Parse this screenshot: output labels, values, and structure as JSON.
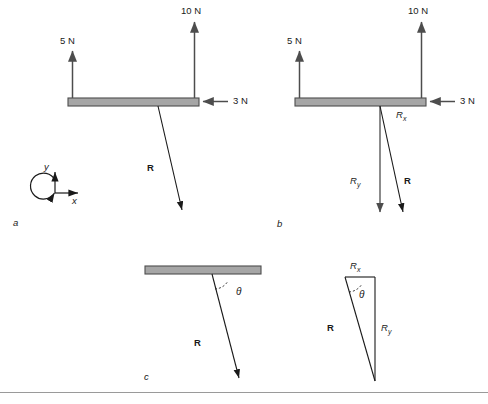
{
  "figure": {
    "title": "",
    "background_color": "#ffffff",
    "beam_fill": "#a6a6a6",
    "beam_stroke": "#4d4d4d",
    "arrow_color": "#4d4d4d",
    "vector_color": "#1a1a1a",
    "rule_color": "#9a9a9a"
  },
  "panels": [
    {
      "id": "a",
      "label": "a",
      "forces": [
        {
          "name": "force-5N",
          "label": "5 N",
          "direction": "up"
        },
        {
          "name": "force-10N",
          "label": "10 N",
          "direction": "up"
        },
        {
          "name": "force-3N",
          "label": "3 N",
          "direction": "left"
        }
      ],
      "vectors": [
        {
          "name": "resultant",
          "label": "R",
          "bold": true
        }
      ],
      "axes": {
        "x_label": "x",
        "y_label": "y",
        "rotation_icon": "curved-ccw-arrow"
      }
    },
    {
      "id": "b",
      "label": "b",
      "forces": [
        {
          "name": "force-5N",
          "label": "5 N",
          "direction": "up"
        },
        {
          "name": "force-10N",
          "label": "10 N",
          "direction": "up"
        },
        {
          "name": "force-3N",
          "label": "3 N",
          "direction": "left"
        }
      ],
      "vectors": [
        {
          "name": "component-x",
          "label": "R",
          "subscript": "x"
        },
        {
          "name": "component-y",
          "label": "R",
          "subscript": "y"
        },
        {
          "name": "resultant",
          "label": "R",
          "bold": true
        }
      ]
    },
    {
      "id": "c",
      "label": "c",
      "vectors": [
        {
          "name": "resultant",
          "label": "R",
          "bold": true
        }
      ],
      "angle": {
        "label": "θ",
        "name": "angle-theta"
      }
    },
    {
      "id": "triangle",
      "label": "",
      "vectors": [
        {
          "name": "component-x",
          "label": "R",
          "subscript": "x"
        },
        {
          "name": "component-y",
          "label": "R",
          "subscript": "y"
        },
        {
          "name": "resultant",
          "label": "R",
          "bold": true
        }
      ],
      "angle": {
        "label": "θ",
        "name": "angle-theta"
      }
    }
  ],
  "labels": {
    "ten_n_a": "10 N",
    "five_n_a": "5 N",
    "three_n_a": "3 N",
    "R_a": "R",
    "axis_x": "x",
    "axis_y": "y",
    "panel_a": "a",
    "ten_n_b": "10 N",
    "five_n_b": "5 N",
    "three_n_b": "3 N",
    "R_b": "R",
    "Rx_b": "R",
    "Rx_b_sub": "x",
    "Ry_b": "R",
    "Ry_b_sub": "y",
    "panel_b": "b",
    "R_c": "R",
    "theta_c": "θ",
    "panel_c": "c",
    "Rx_t": "R",
    "Rx_t_sub": "x",
    "Ry_t": "R",
    "Ry_t_sub": "y",
    "R_t": "R",
    "theta_t": "θ"
  }
}
